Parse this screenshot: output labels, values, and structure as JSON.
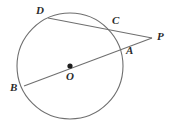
{
  "figure": {
    "kind": "circle-geometry-diagram",
    "title": "",
    "background_color": "#ffffff",
    "stroke_color": "#6b6b6b",
    "label_color": "#2b2b2b",
    "circle": {
      "center_label": "O",
      "center_x": 70,
      "center_y": 66,
      "radius": 53
    },
    "points": [
      {
        "name": "D",
        "label": "D",
        "x": 48,
        "y": 18,
        "on_circle": true,
        "label_x": 36,
        "label_y": 5
      },
      {
        "name": "C",
        "label": "C",
        "x": 111,
        "y": 28,
        "on_circle": true,
        "label_x": 112,
        "label_y": 15
      },
      {
        "name": "P",
        "label": "P",
        "x": 152,
        "y": 38,
        "on_circle": false,
        "label_x": 157,
        "label_y": 31
      },
      {
        "name": "A",
        "label": "A",
        "x": 119,
        "y": 48,
        "on_circle": true,
        "label_x": 126,
        "label_y": 45
      },
      {
        "name": "B",
        "label": "B",
        "x": 24,
        "y": 86,
        "on_circle": true,
        "label_x": 10,
        "label_y": 82
      },
      {
        "name": "O",
        "label": "O",
        "x": 70,
        "y": 66,
        "on_circle": false,
        "label_x": 66,
        "label_y": 71
      }
    ],
    "segments": [
      {
        "name": "secant-D-C-P",
        "from": "D",
        "to": "P",
        "through": [
          "C"
        ]
      },
      {
        "name": "secant-B-O-A-P",
        "from": "B",
        "to": "P",
        "through": [
          "O",
          "A"
        ]
      }
    ],
    "center_dot": {
      "name": "center-dot-O",
      "x": 70,
      "y": 66,
      "radius": 2.6
    }
  }
}
